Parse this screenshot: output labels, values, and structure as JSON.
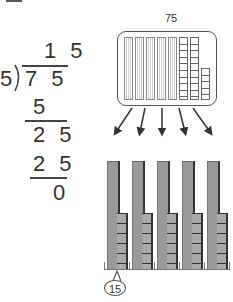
{
  "division": {
    "divisor": "5",
    "dividend": "7 5",
    "quotient": "1 5",
    "steps": [
      {
        "subtract": "5",
        "remainder": "2 5"
      },
      {
        "subtract": "2 5",
        "remainder": "0"
      }
    ]
  },
  "model": {
    "total_label": "75",
    "total_tens": 7,
    "total_ones": 5,
    "groups": 5,
    "group_tens": 1,
    "group_ones": 5,
    "group_value_label": "15"
  },
  "colors": {
    "stroke": "#555555",
    "block_fill": "#999999",
    "block_shadow": "#333333",
    "text": "#333333"
  }
}
